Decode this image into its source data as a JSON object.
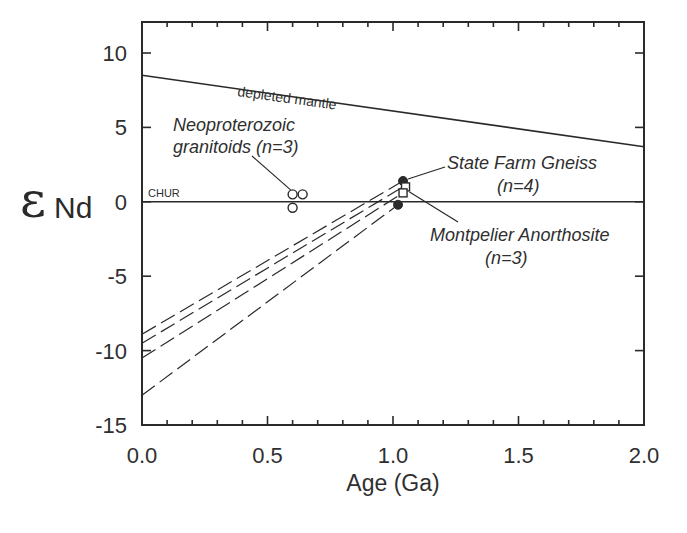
{
  "chart_data": {
    "type": "line",
    "title": "",
    "xlabel": "Age (Ga)",
    "ylabel_symbol": "ε",
    "ylabel_subscript": "Nd",
    "xlim": [
      0.0,
      2.0
    ],
    "ylim": [
      -15,
      12
    ],
    "x_ticks": [
      0.0,
      0.5,
      1.0,
      1.5,
      2.0
    ],
    "x_tick_labels": [
      "0.0",
      "0.5",
      "1.0",
      "1.5",
      "2.0"
    ],
    "x_minor_step": 0.1,
    "y_ticks": [
      10,
      5,
      0,
      -5,
      -10,
      -15
    ],
    "y_tick_labels": [
      "10",
      "5",
      "0",
      "-5",
      "-10",
      "-15"
    ],
    "grid": false,
    "legend": "none (inline annotations)",
    "series": [
      {
        "name": "depleted mantle",
        "style": "solid",
        "x": [
          0.0,
          2.0
        ],
        "y": [
          8.5,
          3.7
        ]
      },
      {
        "name": "CHUR",
        "style": "solid",
        "x": [
          0.0,
          2.0
        ],
        "y": [
          0.0,
          0.0
        ]
      },
      {
        "name": "evolution line 1",
        "style": "dashed",
        "x": [
          0.0,
          1.04
        ],
        "y": [
          -8.9,
          1.4
        ]
      },
      {
        "name": "evolution line 2",
        "style": "dashed",
        "x": [
          0.0,
          1.04
        ],
        "y": [
          -9.5,
          1.0
        ]
      },
      {
        "name": "evolution line 3",
        "style": "dashed",
        "x": [
          0.0,
          1.04
        ],
        "y": [
          -10.5,
          0.6
        ]
      },
      {
        "name": "evolution line 4",
        "style": "dashed",
        "x": [
          0.0,
          1.02
        ],
        "y": [
          -13.0,
          -0.2
        ]
      }
    ],
    "points": [
      {
        "group": "Neoproterozoic granitoids",
        "marker": "open-circle",
        "x": 0.6,
        "y": 0.5
      },
      {
        "group": "Neoproterozoic granitoids",
        "marker": "open-circle",
        "x": 0.64,
        "y": 0.5
      },
      {
        "group": "Neoproterozoic granitoids",
        "marker": "open-circle",
        "x": 0.6,
        "y": -0.4
      },
      {
        "group": "State Farm Gneiss",
        "marker": "filled-circle",
        "x": 1.04,
        "y": 1.4
      },
      {
        "group": "State Farm Gneiss",
        "marker": "filled-circle",
        "x": 1.02,
        "y": -0.2
      },
      {
        "group": "Montpelier Anorthosite",
        "marker": "open-square",
        "x": 1.05,
        "y": 1.0
      },
      {
        "group": "Montpelier Anorthosite",
        "marker": "open-square",
        "x": 1.04,
        "y": 0.6
      }
    ],
    "annotations": [
      {
        "text": "depleted mantle",
        "near_x": 0.55,
        "near_y": 7.2
      },
      {
        "text": "CHUR",
        "near_x": 0.05,
        "near_y": 0.3
      },
      {
        "text": "Neoproterozoic granitoids (n=3)",
        "near_x": 0.35,
        "near_y": 4.0,
        "points_to": [
          0.6,
          0.4
        ]
      },
      {
        "text": "State Farm Gneiss (n=4)",
        "near_x": 1.45,
        "near_y": 2.0,
        "points_to": [
          1.04,
          1.4
        ]
      },
      {
        "text": "Montpelier Anorthosite (n=3)",
        "near_x": 1.45,
        "near_y": -2.5,
        "points_to": [
          1.05,
          0.9
        ]
      }
    ]
  },
  "labels": {
    "depleted_mantle": "depleted mantle",
    "chur": "CHUR",
    "neo_line1": "Neoproterozoic",
    "neo_line2": "granitoids (n=3)",
    "sfg_line1": "State Farm Gneiss",
    "sfg_line2": "(n=4)",
    "ma_line1": "Montpelier Anorthosite",
    "ma_line2": "(n=3)",
    "xlabel": "Age (Ga)",
    "eps": "ε",
    "nd": "Nd"
  },
  "colors": {
    "ink": "#2a2a2a",
    "background": "#ffffff"
  }
}
